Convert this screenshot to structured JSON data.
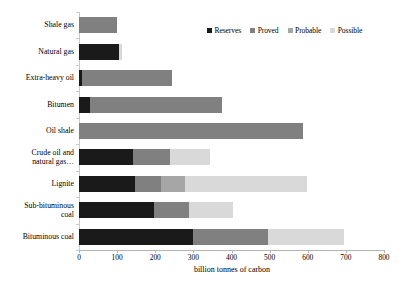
{
  "chart_data": {
    "type": "bar",
    "orientation": "horizontal",
    "stacked": true,
    "title": "",
    "xlabel": "billion tonnes of carbon",
    "ylabel": "",
    "xlim": [
      0,
      800
    ],
    "xticks": [
      0,
      100,
      200,
      300,
      400,
      500,
      600,
      700,
      800
    ],
    "xtick_labels": [
      "0",
      "100",
      "200",
      "300",
      "400",
      "500",
      "600",
      "700",
      "800"
    ],
    "grid": false,
    "legend_position": "top-right",
    "categories": [
      "Shale gas",
      "Natural gas",
      "Extra-heavy oil",
      "Bitumen",
      "Oil shale",
      "Crude oil and\nnatural gas…",
      "Lignite",
      "Sub-bituminous\ncoal",
      "Bituminous coal"
    ],
    "series": [
      {
        "name": "Reserves",
        "color": "#1a1a1a",
        "values": [
          0,
          104,
          8,
          30,
          0,
          141,
          146,
          196,
          300
        ]
      },
      {
        "name": "Proved",
        "color": "#808080",
        "values": [
          100,
          0,
          235,
          345,
          587,
          97,
          69,
          92,
          196
        ]
      },
      {
        "name": "Probable",
        "color": "#a6a6a6",
        "values": [
          0,
          0,
          0,
          0,
          0,
          0,
          63,
          0,
          0
        ]
      },
      {
        "name": "Possible",
        "color": "#d9d9d9",
        "values": [
          0,
          9,
          0,
          0,
          0,
          106,
          320,
          116,
          199
        ]
      }
    ],
    "totals": [
      100,
      113,
      243,
      375,
      587,
      344,
      598,
      404,
      695
    ]
  },
  "legend": {
    "items": [
      {
        "label": "Reserves",
        "color": "#1a1a1a"
      },
      {
        "label": "Proved",
        "color": "#808080"
      },
      {
        "label": "Probable",
        "color": "#a6a6a6"
      },
      {
        "label": "Possible",
        "color": "#d9d9d9"
      }
    ]
  }
}
